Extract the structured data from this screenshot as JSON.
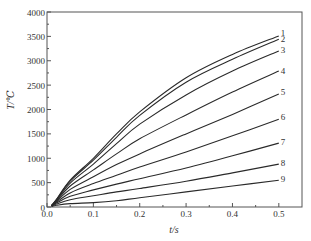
{
  "chart_data": {
    "type": "line",
    "title": "",
    "xlabel": "t/s",
    "ylabel": "T/℃",
    "xlim": [
      0.0,
      0.55
    ],
    "ylim": [
      0,
      4000
    ],
    "xticks": [
      "0.0",
      "0.1",
      "0.2",
      "0.3",
      "0.4",
      "0.5"
    ],
    "xtick_values": [
      0.0,
      0.1,
      0.2,
      0.3,
      0.4,
      0.5
    ],
    "yticks": [
      "0",
      "500",
      "1000",
      "1500",
      "2000",
      "2500",
      "3000",
      "3500",
      "4000"
    ],
    "ytick_values": [
      0,
      500,
      1000,
      1500,
      2000,
      2500,
      3000,
      3500,
      4000
    ],
    "grid": false,
    "legend_position": "inline-right",
    "x": [
      0.01,
      0.02,
      0.05,
      0.1,
      0.15,
      0.2,
      0.3,
      0.4,
      0.5
    ],
    "series": [
      {
        "name": "1",
        "values": [
          30,
          150,
          550,
          1000,
          1500,
          1950,
          2650,
          3130,
          3510
        ]
      },
      {
        "name": "2",
        "values": [
          30,
          145,
          530,
          960,
          1430,
          1880,
          2560,
          3030,
          3440
        ]
      },
      {
        "name": "3",
        "values": [
          30,
          135,
          490,
          880,
          1300,
          1700,
          2300,
          2790,
          3200
        ]
      },
      {
        "name": "4",
        "values": [
          30,
          125,
          430,
          760,
          1090,
          1400,
          1890,
          2360,
          2790
        ]
      },
      {
        "name": "5",
        "values": [
          25,
          110,
          360,
          620,
          870,
          1090,
          1500,
          1900,
          2320
        ]
      },
      {
        "name": "6",
        "values": [
          25,
          95,
          290,
          480,
          650,
          820,
          1130,
          1460,
          1800
        ]
      },
      {
        "name": "7",
        "values": [
          20,
          80,
          220,
          350,
          470,
          580,
          800,
          1050,
          1310
        ]
      },
      {
        "name": "8",
        "values": [
          15,
          60,
          150,
          230,
          310,
          380,
          530,
          700,
          880
        ]
      },
      {
        "name": "9",
        "values": [
          10,
          35,
          70,
          90,
          130,
          190,
          310,
          430,
          550
        ]
      }
    ],
    "label_points": [
      {
        "name": "1",
        "value": 3560
      },
      {
        "name": "2",
        "value": 3440
      },
      {
        "name": "3",
        "value": 3230
      },
      {
        "name": "4",
        "value": 2800
      },
      {
        "name": "5",
        "value": 2350
      },
      {
        "name": "6",
        "value": 1850
      },
      {
        "name": "7",
        "value": 1340
      },
      {
        "name": "8",
        "value": 910
      },
      {
        "name": "9",
        "value": 580
      }
    ]
  },
  "style": {
    "line_color": "#2a2a2a",
    "axis_color": "#555555",
    "text_color": "#333333"
  }
}
